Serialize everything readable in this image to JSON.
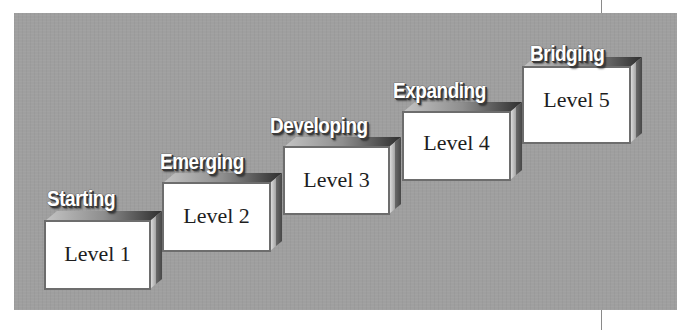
{
  "diagram": {
    "type": "staircase",
    "background_color": "#9f9f9f",
    "steps": [
      {
        "title": "Starting",
        "label": "Level 1"
      },
      {
        "title": "Emerging",
        "label": "Level 2"
      },
      {
        "title": "Developing",
        "label": "Level 3"
      },
      {
        "title": "Expanding",
        "label": "Level 4"
      },
      {
        "title": "Bridging",
        "label": "Level 5"
      }
    ]
  }
}
